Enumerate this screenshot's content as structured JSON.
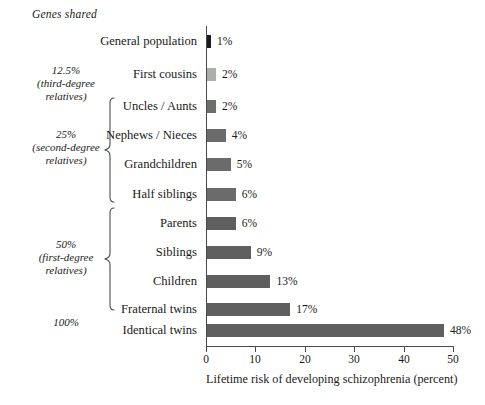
{
  "heading": "Genes shared",
  "chart_data": {
    "type": "bar",
    "orientation": "horizontal",
    "title": "",
    "xlabel": "Lifetime risk of developing schizophrenia (percent)",
    "ylabel": "",
    "xlim": [
      0,
      50
    ],
    "xticks": [
      0,
      10,
      20,
      30,
      40,
      50
    ],
    "xtick_labels": [
      "0",
      "10",
      "20",
      "30",
      "40",
      "50"
    ],
    "grid": false,
    "legend": null,
    "categories": [
      "General population",
      "First cousins",
      "Uncles / Aunts",
      "Nephews / Nieces",
      "Grandchildren",
      "Half siblings",
      "Parents",
      "Siblings",
      "Children",
      "Fraternal twins",
      "Identical twins"
    ],
    "values": [
      1,
      2,
      2,
      4,
      5,
      6,
      6,
      9,
      13,
      17,
      48
    ],
    "value_labels": [
      "1%",
      "2%",
      "2%",
      "4%",
      "5%",
      "6%",
      "6%",
      "9%",
      "13%",
      "17%",
      "48%"
    ],
    "bar_colors": [
      "#1c1c1c",
      "#adadad",
      "#6e6e6e",
      "#6b6b6b",
      "#6b6b6b",
      "#6b6b6b",
      "#5f5f5f",
      "#5f5f5f",
      "#5f5f5f",
      "#5f5f5f",
      "#5f5f5f"
    ]
  },
  "groups": [
    {
      "id": "third-degree",
      "percent": "12.5%",
      "sub_line1": "(third-degree",
      "sub_line2": "relatives)",
      "has_brace": true
    },
    {
      "id": "second-degree",
      "percent": "25%",
      "sub_line1": "(second-degree",
      "sub_line2": "relatives)",
      "has_brace": true
    },
    {
      "id": "first-degree",
      "percent": "50%",
      "sub_line1": "(first-degree",
      "sub_line2": "relatives)",
      "has_brace": true
    },
    {
      "id": "identical",
      "percent": "100%",
      "sub_line1": "",
      "sub_line2": "",
      "has_brace": false
    }
  ],
  "axis": {
    "title": "Lifetime risk of developing schizophrenia (percent)",
    "tick_0": "0",
    "tick_10": "10",
    "tick_20": "20",
    "tick_30": "30",
    "tick_40": "40",
    "tick_50": "50"
  }
}
